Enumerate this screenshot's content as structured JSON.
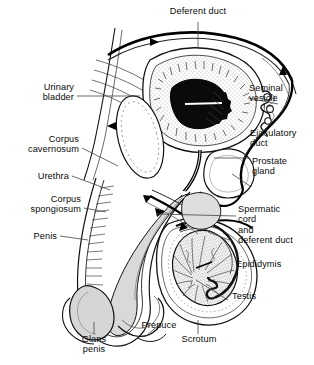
{
  "figure": {
    "width": 314,
    "height": 365,
    "background": "#ffffff",
    "ink": "#000000",
    "tint_light": "#d8d8d8",
    "tint_mid": "#b4b4b4",
    "leader_color": "#333333"
  },
  "labels": {
    "deferent_duct": "Deferent duct",
    "urinary_bladder": "Urinary\nbladder",
    "corpus_cavernosum": "Corpus\ncavernosum",
    "urethra": "Urethra",
    "corpus_spongiosum": "Corpus\nspongiosum",
    "penis": "Penis",
    "glans_penis": "Glans\npenis",
    "prepuce": "Prepuce",
    "scrotum": "Scrotum",
    "testis": "Testis",
    "epididymis": "Epididymis",
    "spermatic_cord": "Spermatic\ncord\nand\ndeferent duct",
    "prostate_gland": "Prostate\ngland",
    "ejaculatory_duct": "Ejaculatory\nduct",
    "seminal_vesicle": "Seminal\nvesicle"
  },
  "flow_arrows": {
    "count": 5,
    "description": "small solid arrowheads along the sperm pathway"
  }
}
